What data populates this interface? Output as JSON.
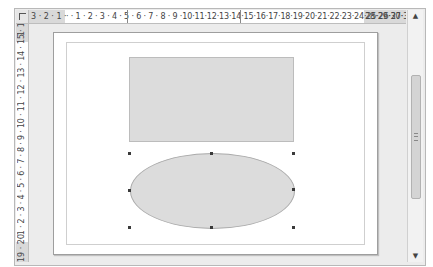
{
  "ruler_horizontal": {
    "labels": "3 · 2 · 1 ·  · · 1 · 2 · 3 · 4 · 5 · 6 · 7 · 8 · 9 ·10·11·12·13·14·15·16·17·18·19·20·21·22·23·24·25·26·27·28·29·30·31·",
    "left_margin_label_text": "3 · 2 · 1 ·",
    "main_label_text": "· · 1 · 2 · 3 · 4 · 5 · 6 · 7 · 8 · 9 ·10·11·12·13·14·15·16·17·18·19·20·21·22·23·24·25·26·27·",
    "right_margin_label_text": "28·29·30·31·"
  },
  "ruler_vertical": {
    "top_margin_label_text": "1",
    "main_label_text": "· 1 · 2 · 3 · 4 · 5 · 6 · 7 · 8 · 9 · 10 · 11 · 12 · 13 · 14 · 15 · 16 · 17 · 18 ·",
    "bottom_margin_label_text": "19 · 20"
  },
  "scrollbar": {
    "up_arrow": "▲",
    "down_arrow": "▼"
  },
  "shapes": [
    {
      "type": "rectangle",
      "fill": "#dcdcdc",
      "stroke": "#bcbcbc",
      "selected": false
    },
    {
      "type": "ellipse",
      "fill": "#dcdcdc",
      "stroke": "#a9a9a9",
      "selected": true
    }
  ],
  "colors": {
    "workspace": "#ececec",
    "page": "#ffffff",
    "ruler_margin": "#d9d9d9",
    "handle": "#3a3a3a"
  }
}
